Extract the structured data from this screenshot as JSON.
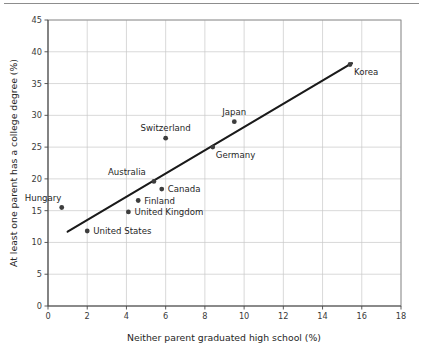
{
  "figure": {
    "top_rule": "horizontal-rule"
  },
  "chart_data": {
    "type": "scatter",
    "title": "",
    "xlabel": "Neither parent graduated high school (%)",
    "ylabel": "At least one parent has a college degree (%)",
    "xlim": [
      0,
      18
    ],
    "ylim": [
      0,
      45
    ],
    "xticks": [
      "0",
      "2",
      "4",
      "6",
      "8",
      "10",
      "12",
      "14",
      "16",
      "18"
    ],
    "xtick_values": [
      0,
      2,
      4,
      6,
      8,
      10,
      12,
      14,
      16,
      18
    ],
    "yticks": [
      "0",
      "5",
      "10",
      "15",
      "20",
      "25",
      "30",
      "35",
      "40",
      "45"
    ],
    "ytick_values": [
      0,
      5,
      10,
      15,
      20,
      25,
      30,
      35,
      40,
      45
    ],
    "grid": true,
    "legend": "none",
    "points": [
      {
        "label": "Hungary",
        "x": 0.7,
        "y": 15.5,
        "label_dx": -37,
        "label_dy": -6,
        "anchor": "start"
      },
      {
        "label": "United States",
        "x": 2.0,
        "y": 11.8,
        "label_dx": 6,
        "label_dy": 3.2,
        "anchor": "start"
      },
      {
        "label": "United Kingdom",
        "x": 4.1,
        "y": 14.8,
        "label_dx": 6,
        "label_dy": 3.4,
        "anchor": "start"
      },
      {
        "label": "Finland",
        "x": 4.6,
        "y": 16.6,
        "label_dx": 6,
        "label_dy": 3.2,
        "anchor": "start"
      },
      {
        "label": "Australia",
        "x": 5.4,
        "y": 19.6,
        "label_dx": -8,
        "label_dy": -6,
        "anchor": "end"
      },
      {
        "label": "Canada",
        "x": 5.8,
        "y": 18.4,
        "label_dx": 6,
        "label_dy": 3.2,
        "anchor": "start"
      },
      {
        "label": "Switzerland",
        "x": 6.0,
        "y": 26.4,
        "label_dx": 0,
        "label_dy": -7,
        "anchor": "middle"
      },
      {
        "label": "Germany",
        "x": 8.4,
        "y": 25.0,
        "label_dx": 3,
        "label_dy": 11,
        "anchor": "start"
      },
      {
        "label": "Japan",
        "x": 9.5,
        "y": 29.0,
        "label_dx": 0,
        "label_dy": -7,
        "anchor": "middle"
      },
      {
        "label": "Korea",
        "x": 15.4,
        "y": 38.0,
        "label_dx": 4,
        "label_dy": 11,
        "anchor": "start"
      }
    ],
    "trendline": {
      "name": "linear-fit",
      "x_start": 1.0,
      "y_start": 11.7,
      "x_end": 15.5,
      "y_end": 38.2
    },
    "colors": {
      "marker": "#3d3d3d",
      "trendline": "#1a1a1a",
      "grid": "#c9c9c9",
      "frame": "#8a8a8a",
      "text": "#262626"
    }
  }
}
